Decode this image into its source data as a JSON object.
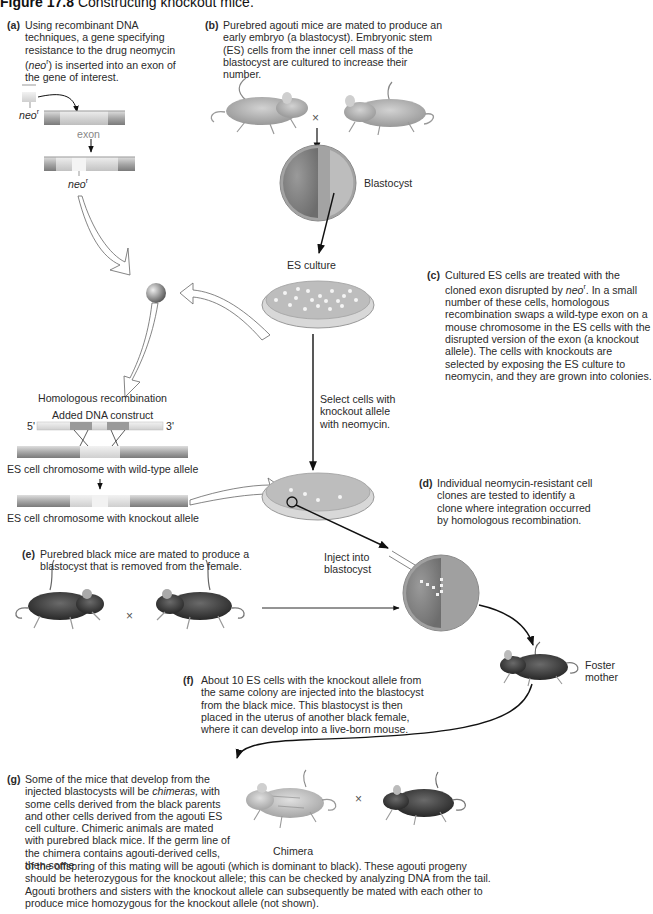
{
  "title": {
    "figure_number": "Figure 17.8",
    "caption": "Constructing knockout mice."
  },
  "steps": {
    "a": {
      "label": "(a)",
      "text_before": "Using recombinant DNA techniques, a gene specifying resistance to the drug neomycin (",
      "italic": "neo",
      "sup": "r",
      "text_after": ") is inserted into an exon of the gene of interest."
    },
    "b": {
      "label": "(b)",
      "text": "Purebred agouti mice are mated to produce an early embryo (a blastocyst). Embryonic stem (ES) cells from the inner cell mass of the blastocyst are cultured to increase their number."
    },
    "c": {
      "label": "(c)",
      "text_before": "Cultured ES cells are treated with the cloned exon disrupted by ",
      "italic": "neo",
      "sup": "r",
      "text_after": ". In a small number of these cells, homologous recombination swaps a wild-type exon on a mouse chromosome in the ES cells with the disrupted version of the exon (a knockout allele). The cells with knockouts are selected by exposing the ES culture to neomycin, and they are grown into colonies."
    },
    "d": {
      "label": "(d)",
      "text": "Individual neomycin-resistant cell clones are tested to identify a clone where integration occurred by homologous recombination."
    },
    "e": {
      "label": "(e)",
      "text": "Purebred black mice are mated to produce a blastocyst that is removed from the female."
    },
    "f": {
      "label": "(f)",
      "text": "About 10 ES cells with the knockout allele from the same colony are injected into the blastocyst from the black mice. This blastocyst is then placed in the uterus of another black female, where it can develop into a live-born mouse."
    },
    "g": {
      "label": "(g)",
      "text_before": "Some of the mice that develop from the injected blastocysts will be ",
      "italic": "chimeras,",
      "text_after": " with some cells derived from the black parents and other cells derived from the agouti ES cell culture. Chimeric animals are mated with purebred black mice. If the germ line of the chimera contains agouti-derived cells, then some",
      "text_full_width": "of the offspring of this mating will be agouti (which is dominant to black). These agouti progeny should be heterozygous for the knockout allele; this can be checked by analyzing DNA from the tail. Agouti brothers and sisters with the knockout allele can subsequently be mated with each other to produce mice homozygous for the knockout allele (not shown)."
    }
  },
  "labels": {
    "neo": "neo",
    "neo_sup": "r",
    "exon": "exon",
    "cross": "×",
    "blastocyst": "Blastocyst",
    "es_culture": "ES culture",
    "select_cells": "Select cells with knockout allele with neomycin.",
    "homologous_recombination": "Homologous recombination",
    "added_dna_construct": "Added DNA construct",
    "five_prime": "5'",
    "three_prime": "3'",
    "wild_type_chromosome": "ES cell chromosome with wild-type allele",
    "knockout_chromosome": "ES cell chromosome with knockout allele",
    "inject_into": "Inject into",
    "blastocyst_lower": "blastocyst",
    "foster": "Foster",
    "mother": "mother",
    "chimera": "Chimera"
  },
  "colors": {
    "agouti_mouse": "#a9a9a9",
    "black_mouse": "#3a3a3a",
    "petri_fill": "#bdbdbd",
    "arrow": "#111111"
  }
}
